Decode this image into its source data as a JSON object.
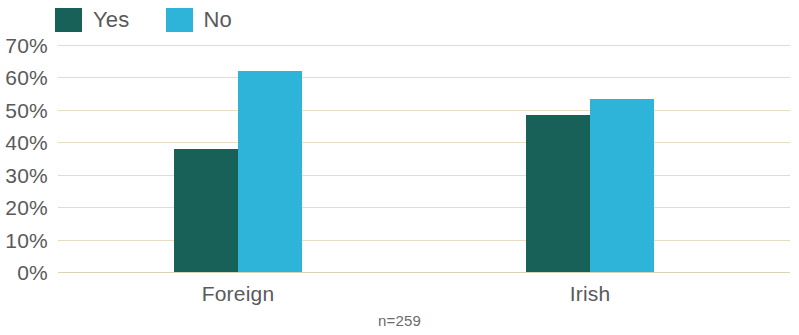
{
  "chart_data": {
    "type": "bar",
    "title": "",
    "subtitle": "",
    "xlabel": "",
    "ylabel": "",
    "categories": [
      "Foreign",
      "Irish"
    ],
    "series": [
      {
        "name": "Yes",
        "color": "#176159",
        "values": [
          38,
          48.5
        ]
      },
      {
        "name": "No",
        "color": "#2eb4d8",
        "values": [
          62,
          53.5
        ]
      }
    ],
    "ylim": [
      0,
      70
    ],
    "ytick_values": [
      70,
      60,
      50,
      40,
      30,
      20,
      10,
      0
    ],
    "ytick_labels": [
      "70%",
      "60%",
      "50%",
      "40%",
      "30%",
      "20%",
      "10%",
      "0%"
    ],
    "grid": true,
    "grid_color": "#e8ddc4",
    "legend_position": "top-left",
    "annotation": "n=259",
    "background": "#ffffff"
  },
  "legend": {
    "items": [
      {
        "label": "Yes",
        "color": "#176159"
      },
      {
        "label": "No",
        "color": "#2eb4d8"
      }
    ]
  },
  "footnote": {
    "text": "n=259"
  }
}
